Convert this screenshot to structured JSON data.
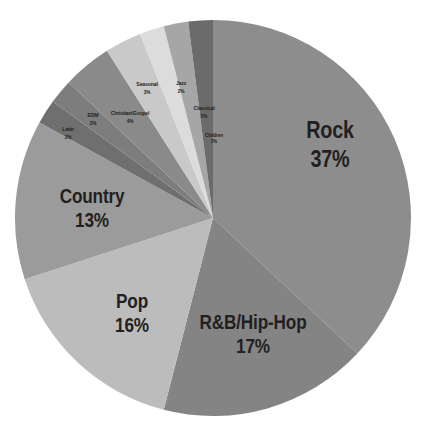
{
  "chart_data": {
    "type": "pie",
    "title": "",
    "subtitle": "",
    "xlabel": "",
    "ylabel": "",
    "legend": "none",
    "grid": false,
    "units": "percent",
    "start_angle_deg": 0,
    "direction": "clockwise",
    "categories": [
      "Rock",
      "R&B/Hip-Hop",
      "Pop",
      "Country",
      "Latin",
      "EDM",
      "Christian/Gospel",
      "Seasonal",
      "Jazz",
      "Classical",
      "Children"
    ],
    "values": [
      37,
      17,
      16,
      13,
      2,
      2,
      4,
      3,
      2,
      2,
      2
    ],
    "slices": [
      {
        "name": "Rock",
        "value": 37,
        "label": "Rock",
        "percent_text": "37%",
        "color": "#8d8d8d",
        "start_deg": 0,
        "end_deg": 133.2,
        "label_x": 330,
        "label_y": 145,
        "size_class": "size-major"
      },
      {
        "name": "R&B/Hip-Hop",
        "value": 17,
        "label": "R&B/Hip-Hop",
        "percent_text": "17%",
        "color": "#848484",
        "start_deg": 133.2,
        "end_deg": 194.4,
        "label_x": 253,
        "label_y": 334,
        "size_class": "size-mid"
      },
      {
        "name": "Pop",
        "value": 16,
        "label": "Pop",
        "percent_text": "16%",
        "color": "#bcbcbc",
        "start_deg": 194.4,
        "end_deg": 252.0,
        "label_x": 132,
        "label_y": 313,
        "size_class": "size-mid"
      },
      {
        "name": "Country",
        "value": 13,
        "label": "Country",
        "percent_text": "13%",
        "color": "#9b9b9b",
        "start_deg": 252.0,
        "end_deg": 298.8,
        "label_x": 92,
        "label_y": 208,
        "size_class": "size-mid"
      },
      {
        "name": "Latin",
        "value": 2,
        "label": "Latin",
        "percent_text": "2%",
        "color": "#6f6f6f",
        "start_deg": 298.8,
        "end_deg": 306.0,
        "label_x": 68,
        "label_y": 133,
        "size_class": "size-tiny"
      },
      {
        "name": "EDM",
        "value": 2,
        "label": "EDM",
        "percent_text": "2%",
        "color": "#7d7d7d",
        "start_deg": 306.0,
        "end_deg": 313.2,
        "label_x": 93,
        "label_y": 119,
        "size_class": "size-tiny"
      },
      {
        "name": "Christian/Gospel",
        "value": 4,
        "label": "Christian/Gospel",
        "percent_text": "4%",
        "color": "#8a8a8a",
        "start_deg": 313.2,
        "end_deg": 327.6,
        "label_x": 130,
        "label_y": 117,
        "size_class": "size-tiny"
      },
      {
        "name": "Seasonal",
        "value": 3,
        "label": "Seasonal",
        "percent_text": "3%",
        "color": "#c9c9c9",
        "start_deg": 327.6,
        "end_deg": 338.4,
        "label_x": 147,
        "label_y": 88,
        "size_class": "size-tiny"
      },
      {
        "name": "Jazz",
        "value": 2,
        "label": "Jazz",
        "percent_text": "2%",
        "color": "#dcdcdc",
        "start_deg": 338.4,
        "end_deg": 345.6,
        "label_x": 181,
        "label_y": 87,
        "size_class": "size-tiny"
      },
      {
        "name": "Classical",
        "value": 2,
        "label": "Classical",
        "percent_text": "2%",
        "color": "#a6a6a6",
        "start_deg": 345.6,
        "end_deg": 352.8,
        "label_x": 204,
        "label_y": 112,
        "size_class": "size-tiny"
      },
      {
        "name": "Children",
        "value": 2,
        "label": "Children",
        "percent_text": "2%",
        "color": "#6b6b6b",
        "start_deg": 352.8,
        "end_deg": 360.0,
        "label_x": 214,
        "label_y": 138,
        "size_class": "size-micro"
      }
    ],
    "geometry": {
      "center_x": 213,
      "center_y": 218,
      "radius": 198
    },
    "colors": {
      "background": "#ffffff",
      "text": "#231f20"
    }
  }
}
